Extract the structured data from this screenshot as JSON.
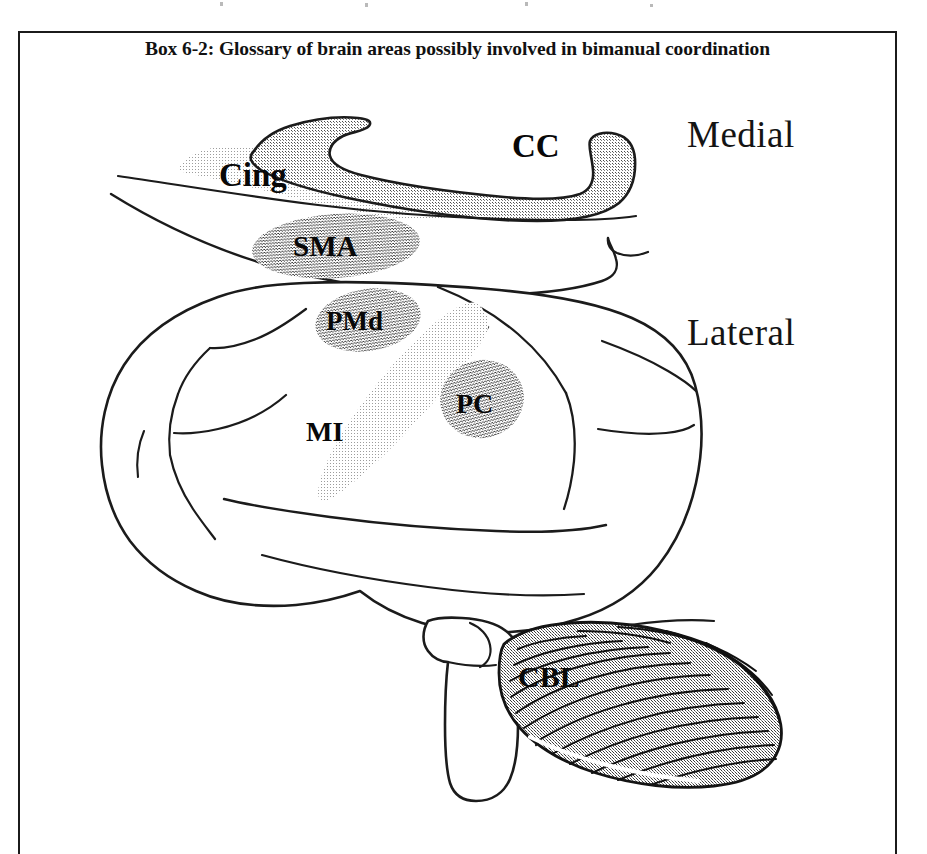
{
  "figure": {
    "box_title": "Box 6-2: Glossary of brain areas possibly involved in bimanual coordination",
    "background_color": "#ffffff",
    "border_color": "#1b1b1b",
    "ink_color": "#111111"
  },
  "view_labels": {
    "medial": "Medial",
    "lateral": "Lateral"
  },
  "regions": [
    {
      "id": "cc",
      "label": "CC",
      "view": "medial",
      "shade": "#a8a8a8",
      "font_size": 33
    },
    {
      "id": "cing",
      "label": "Cing",
      "view": "medial",
      "shade": "#d2d2d2",
      "font_size": 33
    },
    {
      "id": "sma",
      "label": "SMA",
      "view": "medial",
      "shade": "#8a8a8a",
      "font_size": 29
    },
    {
      "id": "pmd",
      "label": "PMd",
      "view": "lateral",
      "shade": "#8e8e8e",
      "font_size": 27
    },
    {
      "id": "mi",
      "label": "MI",
      "view": "lateral",
      "shade": "#bdbdbd",
      "font_size": 28
    },
    {
      "id": "pc",
      "label": "PC",
      "view": "lateral",
      "shade": "#8c8c8c",
      "font_size": 28
    },
    {
      "id": "cbl",
      "label": "CBL",
      "view": "lateral",
      "shade": "#9a9a9a",
      "font_size": 30
    }
  ]
}
